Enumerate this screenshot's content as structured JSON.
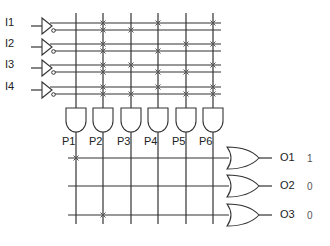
{
  "diagram": {
    "type": "programmable-logic-array",
    "inputs": [
      {
        "label": "I1",
        "y": 23
      },
      {
        "label": "I2",
        "y": 44
      },
      {
        "label": "I3",
        "y": 65
      },
      {
        "label": "I4",
        "y": 87
      }
    ],
    "product_terms": [
      {
        "label": "P1",
        "x": 76
      },
      {
        "label": "P2",
        "x": 103
      },
      {
        "label": "P3",
        "x": 131
      },
      {
        "label": "P4",
        "x": 158
      },
      {
        "label": "P5",
        "x": 186
      },
      {
        "label": "P6",
        "x": 213
      }
    ],
    "and_plane_connections": {
      "P1": [],
      "P2": [
        "I1",
        "~I1",
        "I2",
        "~I2",
        "I3",
        "~I3",
        "I4",
        "~I4"
      ],
      "P3": [
        "~I1",
        "I3",
        "~I4"
      ],
      "P4": [
        "I1",
        "~I2",
        "~I3",
        "I4"
      ],
      "P5": [
        "I2",
        "~I3",
        "~I4"
      ],
      "P6": [
        "I1",
        "I2",
        "I3",
        "I4",
        "~I4"
      ]
    },
    "outputs": [
      {
        "label": "O1",
        "value": "1",
        "y": 158
      },
      {
        "label": "O2",
        "value": "0",
        "y": 186
      },
      {
        "label": "O3",
        "value": "0",
        "y": 215
      }
    ],
    "or_plane_connections": {
      "O1": [
        "P1"
      ],
      "O2": [],
      "O3": [
        "P2"
      ]
    },
    "colors": {
      "line": "#333333",
      "cross": "#555555",
      "text": "#222222",
      "value": "#555555"
    }
  }
}
